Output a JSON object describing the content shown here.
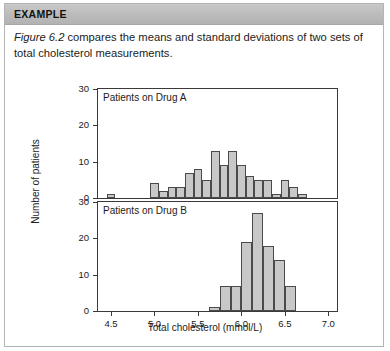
{
  "header": {
    "label": "EXAMPLE"
  },
  "body": {
    "figure_ref": "Figure 6.2",
    "paragraph": " compares the means and standard deviations of two sets of total cholesterol measurements."
  },
  "chart_data": {
    "type": "bar",
    "title": "",
    "xlabel": "Total cholesterol (mmol/L)",
    "ylabel": "Number of patients",
    "xlim": [
      4.35,
      7.1
    ],
    "ylim": [
      0,
      30
    ],
    "xticks": [
      "4.5",
      "5.0",
      "5.5",
      "6.0",
      "6.5",
      "7.0"
    ],
    "xtick_values": [
      4.5,
      5.0,
      5.5,
      6.0,
      6.5,
      7.0
    ],
    "yticks": [
      "0",
      "10",
      "20",
      "30"
    ],
    "ytick_values": [
      0,
      10,
      20,
      30
    ],
    "grid": false,
    "legend": "none",
    "bar_fill": "#c8c8c8",
    "bar_stroke": "#4a4a4a",
    "panels": [
      {
        "name": "panel-drug-a",
        "title": "Patients on Drug A",
        "bin_width": 0.1,
        "bins": [
          4.45,
          4.55,
          4.65,
          4.75,
          4.85,
          4.95,
          5.05,
          5.15,
          5.25,
          5.35,
          5.45,
          5.55,
          5.65,
          5.75,
          5.85,
          5.95,
          6.05,
          6.15,
          6.25,
          6.35,
          6.45,
          6.55,
          6.65,
          6.75,
          6.85,
          6.95
        ],
        "values": [
          1,
          0,
          0,
          0,
          0,
          4,
          2,
          3,
          3,
          7,
          8,
          5,
          13,
          9,
          13,
          9,
          6,
          5,
          5,
          1,
          5,
          3,
          1,
          0,
          0,
          0
        ]
      },
      {
        "name": "panel-drug-b",
        "title": "Patients on Drug B",
        "bin_width": 0.125,
        "bins": [
          5.625,
          5.75,
          5.875,
          6.0,
          6.125,
          6.25,
          6.375,
          6.5
        ],
        "values": [
          1,
          7,
          7,
          19,
          27,
          18,
          14,
          7
        ]
      }
    ]
  }
}
